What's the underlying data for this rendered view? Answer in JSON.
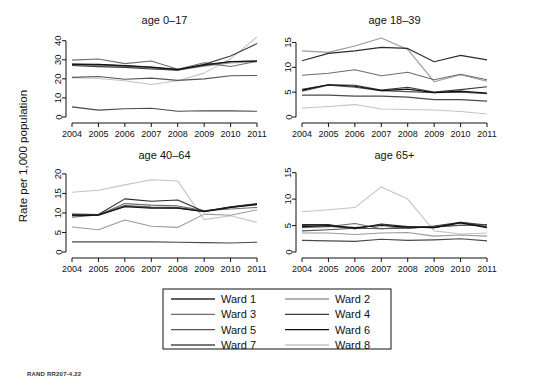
{
  "figure": {
    "ylabel": "Rate per 1,000 population",
    "credit": "RAND RR207-4.22"
  },
  "legend": {
    "items": [
      {
        "label": "Ward 1",
        "color": "#2b2b2b"
      },
      {
        "label": "Ward 2",
        "color": "#9a9a9a"
      },
      {
        "label": "Ward 3",
        "color": "#6e6e6e"
      },
      {
        "label": "Ward 4",
        "color": "#3d3d3d"
      },
      {
        "label": "Ward 5",
        "color": "#555555"
      },
      {
        "label": "Ward 6",
        "color": "#111111"
      },
      {
        "label": "Ward 7",
        "color": "#4a4a4a"
      },
      {
        "label": "Ward 8",
        "color": "#c4c4c4"
      }
    ]
  },
  "chart_data": [
    {
      "type": "line",
      "title": "age 0–17",
      "xlabel": "",
      "ylabel": "Rate per 1,000 population",
      "x": [
        2004,
        2005,
        2006,
        2007,
        2008,
        2009,
        2010,
        2011
      ],
      "xticklabels": [
        "2004",
        "2005",
        "2006",
        "2007",
        "2008",
        "2009",
        "2010",
        "2011"
      ],
      "yticks": [
        0,
        10,
        20,
        30,
        40
      ],
      "ylim": [
        0,
        43
      ],
      "grid": false,
      "series": [
        {
          "name": "Ward 1",
          "color": "#2b2b2b",
          "values": [
            27.6,
            27.4,
            26.8,
            26.0,
            24.8,
            27.0,
            29.0,
            29.3
          ]
        },
        {
          "name": "Ward 2",
          "color": "#9a9a9a",
          "values": [
            27.2,
            27.0,
            26.4,
            25.6,
            24.6,
            26.6,
            28.4,
            29.0
          ]
        },
        {
          "name": "Ward 3",
          "color": "#6e6e6e",
          "values": [
            29.8,
            30.4,
            28.0,
            29.4,
            25.0,
            28.4,
            26.5,
            29.2
          ]
        },
        {
          "name": "Ward 4",
          "color": "#3d3d3d",
          "values": [
            27.0,
            26.4,
            26.0,
            25.2,
            24.6,
            27.6,
            32.0,
            38.5
          ]
        },
        {
          "name": "Ward 5",
          "color": "#555555",
          "values": [
            20.8,
            21.2,
            19.8,
            20.4,
            19.2,
            20.0,
            21.6,
            21.8
          ]
        },
        {
          "name": "Ward 6",
          "color": "#111111",
          "values": [
            27.8,
            27.6,
            27.0,
            26.2,
            25.0,
            27.4,
            29.1,
            29.4
          ]
        },
        {
          "name": "Ward 7",
          "color": "#4a4a4a",
          "values": [
            5.3,
            3.6,
            4.3,
            4.6,
            3.0,
            3.3,
            3.2,
            3.0
          ]
        },
        {
          "name": "Ward 8",
          "color": "#c4c4c4",
          "values": [
            20.6,
            20.2,
            19.0,
            17.0,
            19.0,
            23.0,
            30.5,
            42.0
          ]
        }
      ]
    },
    {
      "type": "line",
      "title": "age 18–39",
      "xlabel": "",
      "ylabel": "",
      "x": [
        2004,
        2005,
        2006,
        2007,
        2008,
        2009,
        2010,
        2011
      ],
      "xticklabels": [
        "2004",
        "2005",
        "2006",
        "2007",
        "2008",
        "2009",
        "2010",
        "2011"
      ],
      "yticks": [
        0,
        5,
        10,
        15
      ],
      "ylim": [
        0,
        16.5
      ],
      "grid": false,
      "series": [
        {
          "name": "Ward 1",
          "color": "#2b2b2b",
          "values": [
            11.3,
            12.8,
            13.3,
            14.0,
            13.8,
            11.1,
            12.4,
            11.5
          ]
        },
        {
          "name": "Ward 2",
          "color": "#9a9a9a",
          "values": [
            13.3,
            13.0,
            14.3,
            15.9,
            13.6,
            7.1,
            8.5,
            7.2
          ]
        },
        {
          "name": "Ward 3",
          "color": "#6e6e6e",
          "values": [
            8.4,
            8.8,
            9.5,
            8.3,
            9.0,
            7.5,
            8.6,
            7.5
          ]
        },
        {
          "name": "Ward 4",
          "color": "#3d3d3d",
          "values": [
            5.6,
            6.5,
            6.4,
            5.4,
            6.0,
            5.0,
            5.5,
            6.1
          ]
        },
        {
          "name": "Ward 5",
          "color": "#555555",
          "values": [
            5.2,
            6.4,
            6.0,
            5.3,
            5.1,
            4.9,
            5.0,
            4.7
          ]
        },
        {
          "name": "Ward 6",
          "color": "#111111",
          "values": [
            5.4,
            6.5,
            6.2,
            5.3,
            5.6,
            4.9,
            5.2,
            4.8
          ]
        },
        {
          "name": "Ward 7",
          "color": "#4a4a4a",
          "values": [
            4.4,
            4.4,
            4.2,
            4.2,
            4.0,
            3.5,
            3.5,
            3.2
          ]
        },
        {
          "name": "Ward 8",
          "color": "#c4c4c4",
          "values": [
            1.8,
            2.1,
            2.5,
            1.6,
            1.5,
            1.4,
            1.1,
            0.6
          ]
        }
      ]
    },
    {
      "type": "line",
      "title": "age 40–64",
      "xlabel": "",
      "ylabel": "",
      "x": [
        2004,
        2005,
        2006,
        2007,
        2008,
        2009,
        2010,
        2011
      ],
      "xticklabels": [
        "2004",
        "2005",
        "2006",
        "2007",
        "2008",
        "2009",
        "2010",
        "2011"
      ],
      "yticks": [
        0,
        5,
        10,
        15,
        20
      ],
      "ylim": [
        0,
        21
      ],
      "grid": false,
      "series": [
        {
          "name": "Ward 1",
          "color": "#2b2b2b",
          "values": [
            9.7,
            9.6,
            13.6,
            13.0,
            13.3,
            10.4,
            11.6,
            12.4
          ]
        },
        {
          "name": "Ward 2",
          "color": "#9a9a9a",
          "values": [
            6.4,
            5.7,
            8.2,
            6.6,
            6.3,
            9.7,
            9.4,
            10.8
          ]
        },
        {
          "name": "Ward 3",
          "color": "#6e6e6e",
          "values": [
            8.9,
            9.5,
            12.4,
            12.0,
            11.8,
            10.6,
            11.0,
            11.4
          ]
        },
        {
          "name": "Ward 4",
          "color": "#3d3d3d",
          "values": [
            9.4,
            9.5,
            11.7,
            11.4,
            11.3,
            10.4,
            11.5,
            12.3
          ]
        },
        {
          "name": "Ward 5",
          "color": "#555555",
          "values": [
            9.5,
            9.6,
            11.9,
            11.5,
            11.4,
            10.5,
            11.4,
            12.1
          ]
        },
        {
          "name": "Ward 6",
          "color": "#111111",
          "values": [
            9.3,
            9.4,
            11.6,
            11.2,
            11.2,
            10.3,
            11.4,
            12.2
          ]
        },
        {
          "name": "Ward 7",
          "color": "#4a4a4a",
          "values": [
            2.6,
            2.6,
            2.6,
            2.6,
            2.5,
            2.4,
            2.3,
            2.5
          ]
        },
        {
          "name": "Ward 8",
          "color": "#c4c4c4",
          "values": [
            15.3,
            15.8,
            17.2,
            18.5,
            18.2,
            8.3,
            9.3,
            7.6
          ]
        }
      ]
    },
    {
      "type": "line",
      "title": "age 65+",
      "xlabel": "",
      "ylabel": "",
      "x": [
        2004,
        2005,
        2006,
        2007,
        2008,
        2009,
        2010,
        2011
      ],
      "xticklabels": [
        "2004",
        "2005",
        "2006",
        "2007",
        "2008",
        "2009",
        "2010",
        "2011"
      ],
      "yticks": [
        0,
        5,
        10,
        15
      ],
      "ylim": [
        0,
        15.5
      ],
      "grid": false,
      "series": [
        {
          "name": "Ward 1",
          "color": "#2b2b2b",
          "values": [
            5.2,
            5.2,
            4.4,
            5.3,
            4.8,
            4.6,
            5.6,
            4.7
          ]
        },
        {
          "name": "Ward 2",
          "color": "#9a9a9a",
          "values": [
            3.6,
            3.6,
            3.3,
            3.6,
            3.7,
            3.0,
            3.2,
            3.0
          ]
        },
        {
          "name": "Ward 3",
          "color": "#6e6e6e",
          "values": [
            4.6,
            4.8,
            5.4,
            4.4,
            4.8,
            4.7,
            5.1,
            5.2
          ]
        },
        {
          "name": "Ward 4",
          "color": "#3d3d3d",
          "values": [
            5.0,
            4.9,
            4.4,
            5.2,
            4.5,
            4.9,
            5.6,
            5.1
          ]
        },
        {
          "name": "Ward 5",
          "color": "#555555",
          "values": [
            4.0,
            4.2,
            4.5,
            4.4,
            4.5,
            4.8,
            5.0,
            5.1
          ]
        },
        {
          "name": "Ward 6",
          "color": "#111111",
          "values": [
            4.8,
            5.0,
            4.6,
            5.0,
            4.7,
            4.6,
            5.5,
            4.6
          ]
        },
        {
          "name": "Ward 7",
          "color": "#4a4a4a",
          "values": [
            2.2,
            2.1,
            2.0,
            2.4,
            2.2,
            2.3,
            2.5,
            2.1
          ]
        },
        {
          "name": "Ward 8",
          "color": "#c4c4c4",
          "values": [
            7.6,
            8.0,
            8.4,
            12.3,
            10.0,
            4.0,
            3.4,
            3.6
          ]
        }
      ]
    }
  ]
}
